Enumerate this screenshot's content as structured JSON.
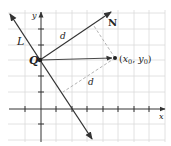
{
  "diagram": {
    "type": "geometry-distance-point-to-line",
    "labels": {
      "line": "L",
      "normal": "N",
      "point_q": "Q",
      "point_p": "(x₀, y₀)",
      "point_p_x": "x",
      "point_p_x_sub": "0",
      "point_p_y": "y",
      "point_p_y_sub": "0",
      "d_upper": "d",
      "d_lower": "d",
      "x_axis": "x",
      "y_axis": "y"
    },
    "colors": {
      "grid": "#d9d9d9",
      "axes": "#333333",
      "vectors": "#333333",
      "dashed": "#aaaaaa",
      "background": "#ffffff"
    }
  }
}
